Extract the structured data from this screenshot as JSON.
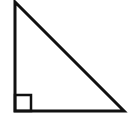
{
  "diagram": {
    "type": "right-triangle",
    "stroke_color": "#111111",
    "background": "#ffffff",
    "stroke_width": 3,
    "vertices": {
      "top": {
        "x": 15,
        "y": 2
      },
      "right_angle": {
        "x": 15,
        "y": 111
      },
      "bottom_right": {
        "x": 124,
        "y": 111
      }
    },
    "right_angle_marker": {
      "x": 15,
      "y": 95,
      "size": 16
    },
    "labels": []
  }
}
